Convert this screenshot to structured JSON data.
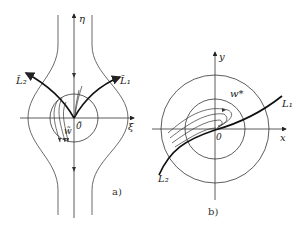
{
  "figure_a": {
    "axis_vertical": "η",
    "axis_horizontal": "ξ",
    "origin": "0̃",
    "curve_right": "L̃₁",
    "curve_left": "L̃₂",
    "region": "w̃",
    "caption": "a)"
  },
  "figure_b": {
    "axis_vertical": "y",
    "axis_horizontal": "x",
    "origin": "0",
    "curve_right": "L₁",
    "curve_left": "L₂",
    "region": "w*",
    "caption": "b)"
  },
  "colors": {
    "line": "#333333",
    "bold": "#111111"
  }
}
